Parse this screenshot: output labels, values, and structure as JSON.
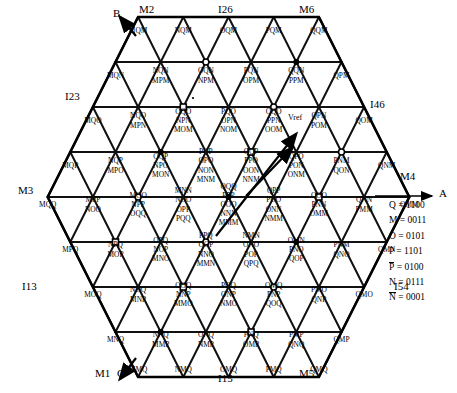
{
  "figure": {
    "type": "space-vector-hexagon-diagram",
    "axis_label_a": "A",
    "vref_label": "Vref"
  },
  "outer_labels": [
    {
      "name": "B",
      "x": 113,
      "y": 17
    },
    {
      "name": "M2",
      "x": 139,
      "y": 13
    },
    {
      "name": "I26",
      "x": 218,
      "y": 13
    },
    {
      "name": "M6",
      "x": 299,
      "y": 13
    },
    {
      "name": "I23",
      "x": 65,
      "y": 100
    },
    {
      "name": "I46",
      "x": 370,
      "y": 108
    },
    {
      "name": "M3",
      "x": 18,
      "y": 194
    },
    {
      "name": "M4",
      "x": 400,
      "y": 180
    },
    {
      "name": "A",
      "x": 439,
      "y": 197
    },
    {
      "name": "I13",
      "x": 22,
      "y": 290
    },
    {
      "name": "I54",
      "x": 394,
      "y": 290
    },
    {
      "name": "M1",
      "x": 95,
      "y": 377
    },
    {
      "name": "C",
      "x": 117,
      "y": 377
    },
    {
      "name": "I15",
      "x": 218,
      "y": 382
    },
    {
      "name": "M5",
      "x": 299,
      "y": 377
    }
  ],
  "legend": {
    "title": "",
    "entries": [
      {
        "symbol": "Q",
        "overbar": false,
        "value": "1100"
      },
      {
        "symbol": "M",
        "overbar": false,
        "value": "0011"
      },
      {
        "symbol": "O",
        "overbar": false,
        "value": "0101"
      },
      {
        "symbol": "P",
        "overbar": false,
        "value": "1101"
      },
      {
        "symbol": "P",
        "overbar": true,
        "value": "0100"
      },
      {
        "symbol": "N",
        "overbar": false,
        "value": "0111"
      },
      {
        "symbol": "N",
        "overbar": true,
        "value": "0001"
      }
    ]
  },
  "chart_data": {
    "type": "scatter",
    "rows": [
      {
        "row": 1,
        "cells": [
          {
            "labels": [
              "MQM"
            ]
          },
          {
            "labels": [
              "NQM"
            ]
          },
          {
            "labels": [
              "OQM"
            ]
          },
          {
            "labels": [
              "PQM"
            ]
          },
          {
            "labels": [
              "QQM"
            ]
          }
        ]
      },
      {
        "row": 2,
        "cells": [
          {
            "labels": [
              "MQN"
            ]
          },
          {
            "labels": [
              "NQN",
              "MPM"
            ]
          },
          {
            "labels": [
              "OQN",
              "NPM"
            ]
          },
          {
            "labels": [
              "PQN",
              "OPM"
            ]
          },
          {
            "labels": [
              "QQN",
              "PPM"
            ]
          },
          {
            "labels": [
              "QPM"
            ]
          }
        ]
      },
      {
        "row": 3,
        "cells": [
          {
            "labels": [
              "MQO"
            ]
          },
          {
            "labels": [
              "NQO",
              "MPN"
            ]
          },
          {
            "labels": [
              "OQO",
              "NPN",
              "MOM"
            ]
          },
          {
            "labels": [
              "PQO",
              "OPN",
              "NOM"
            ]
          },
          {
            "labels": [
              "QQO",
              "PPN",
              "OOM"
            ]
          },
          {
            "labels": [
              "QPN",
              "POM"
            ]
          },
          {
            "labels": [
              "QOM"
            ]
          }
        ]
      },
      {
        "row": 4,
        "cells": [
          {
            "labels": [
              "MQP"
            ]
          },
          {
            "labels": [
              "NQP",
              "MPO"
            ]
          },
          {
            "labels": [
              "OQP",
              "NPO",
              "MON"
            ]
          },
          {
            "labels": [
              "PQP",
              "OPO",
              "NON",
              "MNM"
            ]
          },
          {
            "labels": [
              "QQP",
              "PPO",
              "OON",
              "NNM"
            ]
          },
          {
            "labels": [
              "QPO",
              "PON",
              "ONM"
            ]
          },
          {
            "labels": [
              "PNM",
              "QON"
            ]
          },
          {
            "labels": [
              "QNM"
            ]
          }
        ]
      },
      {
        "row": 5,
        "cells": [
          {
            "labels": [
              "MQQ"
            ]
          },
          {
            "labels": [
              "MPP",
              "NOO"
            ]
          },
          {
            "labels": [
              "MOO",
              "NPP",
              "OQQ"
            ]
          },
          {
            "labels": [
              "MNN",
              "NOO",
              "OPP",
              "PQQ"
            ]
          },
          {
            "labels": [
              "QQQ",
              "PPP",
              "OOO",
              "NNN",
              "MMM"
            ]
          },
          {
            "labels": [
              "QPP",
              "POO",
              "ONN",
              "NMM"
            ]
          },
          {
            "labels": [
              "QOO",
              "PNN",
              "OMM"
            ]
          },
          {
            "labels": [
              "QNN",
              "PMM"
            ]
          },
          {
            "labels": [
              "QMM"
            ]
          }
        ]
      },
      {
        "row": 6,
        "cells": [
          {
            "labels": [
              "MPQ"
            ]
          },
          {
            "labels": [
              "NPQ",
              "MOP"
            ]
          },
          {
            "labels": [
              "OPQ",
              "NOP",
              "MNO"
            ]
          },
          {
            "labels": [
              "PPQ",
              "OOP",
              "NNO",
              "MMN"
            ]
          },
          {
            "labels": [
              "NMN",
              "ONO",
              "POP",
              "QPQ"
            ]
          },
          {
            "labels": [
              "OMN",
              "PNO",
              "QOP"
            ]
          },
          {
            "labels": [
              "PNM",
              "QNO"
            ]
          },
          {
            "labels": [
              "QMN"
            ]
          }
        ]
      },
      {
        "row": 7,
        "cells": [
          {
            "labels": [
              "MOQ"
            ]
          },
          {
            "labels": [
              "NOQ",
              "MNP"
            ]
          },
          {
            "labels": [
              "OOQ",
              "NNP",
              "MMO"
            ]
          },
          {
            "labels": [
              "POQ",
              "ONP",
              "NMO"
            ]
          },
          {
            "labels": [
              "OMQ",
              "PNP",
              "QOQ"
            ]
          },
          {
            "labels": [
              "PMO",
              "QNP"
            ]
          },
          {
            "labels": [
              "QMO"
            ]
          }
        ]
      },
      {
        "row": 8,
        "cells": [
          {
            "labels": [
              "MNQ"
            ]
          },
          {
            "labels": [
              "NNQ",
              "MMP"
            ]
          },
          {
            "labels": [
              "ONQ",
              "NMP"
            ]
          },
          {
            "labels": [
              "PNQ",
              "OMP"
            ]
          },
          {
            "labels": [
              "PMP",
              "QNQ"
            ]
          },
          {
            "labels": [
              "QMP"
            ]
          }
        ]
      },
      {
        "row": 9,
        "cells": [
          {
            "labels": [
              "MMQ"
            ]
          },
          {
            "labels": [
              "NMQ"
            ]
          },
          {
            "labels": [
              "OMQ"
            ]
          },
          {
            "labels": [
              "PMQ"
            ]
          },
          {
            "labels": [
              "QMQ"
            ]
          }
        ]
      }
    ]
  }
}
